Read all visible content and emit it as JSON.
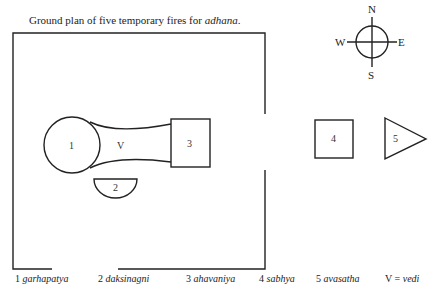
{
  "title": {
    "prefix": "Ground plan of five temporary fires for ",
    "italic": "adhana",
    "suffix": "."
  },
  "compass": {
    "north": "N",
    "south": "S",
    "east": "E",
    "west": "W"
  },
  "shapes": {
    "fire_1_label": "1",
    "fire_2_label": "2",
    "fire_3_label": "3",
    "fire_4_label": "4",
    "fire_5_label": "5",
    "vedi_label": "V"
  },
  "legend": [
    {
      "num": "1",
      "name": "garhapatya"
    },
    {
      "num": "2",
      "name": "daksinagni"
    },
    {
      "num": "3",
      "name": "ahavaniya"
    },
    {
      "num": "4",
      "name": "sabhya"
    },
    {
      "num": "5",
      "name": "avasatha"
    },
    {
      "num": "V =",
      "name": "vedi"
    }
  ],
  "colors": {
    "line": "#222222",
    "background": "#ffffff"
  }
}
